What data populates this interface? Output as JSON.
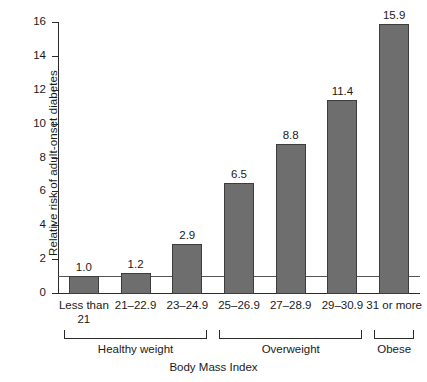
{
  "chart_data": {
    "type": "bar",
    "title": "",
    "xlabel": "Body Mass Index",
    "ylabel": "Relative risk of adult-onset diabetes",
    "categories": [
      "Less than 21",
      "21–22.9",
      "23–24.9",
      "25–26.9",
      "27–28.9",
      "29–30.9",
      "31 or more"
    ],
    "values": [
      1.0,
      1.2,
      2.9,
      6.5,
      8.8,
      11.4,
      15.9
    ],
    "value_labels": [
      "1.0",
      "1.2",
      "2.9",
      "6.5",
      "8.8",
      "11.4",
      "15.9"
    ],
    "ylim": [
      0,
      16
    ],
    "yticks": [
      0,
      2,
      4,
      6,
      8,
      10,
      12,
      14,
      16
    ],
    "ytick_labels": [
      "0",
      "2",
      "4",
      "6",
      "8",
      "10",
      "12",
      "14",
      "16"
    ],
    "grid": false,
    "legend": "none",
    "reference_line": {
      "value": 1.0,
      "label": ""
    },
    "groups": [
      {
        "label": "Healthy weight",
        "from": 0,
        "to": 2
      },
      {
        "label": "Overweight",
        "from": 3,
        "to": 5
      },
      {
        "label": "Obese",
        "from": 6,
        "to": 6
      }
    ],
    "bar_color": "#6e6e6e",
    "bar_edge_color": "#3d3d3d",
    "axis_color": "#2b2b2b",
    "reference_line_color": "#555555"
  }
}
